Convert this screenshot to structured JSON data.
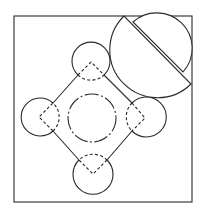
{
  "figure": {
    "type": "geometric-line-drawing",
    "colors": {
      "line": "#2a2a2a",
      "background": "#ffffff"
    },
    "frame": {
      "x": 14,
      "y": 16,
      "width": 178,
      "height": 186
    },
    "diamond_vertices": [
      {
        "name": "top",
        "cx": 91,
        "cy": 62
      },
      {
        "name": "right",
        "cx": 146,
        "cy": 118
      },
      {
        "name": "bottom",
        "cx": 93,
        "cy": 174
      },
      {
        "name": "left",
        "cx": 39,
        "cy": 117
      }
    ],
    "corner_circles": [
      {
        "name": "top",
        "cx": 91,
        "cy": 61,
        "r": 19
      },
      {
        "name": "right",
        "cx": 145,
        "cy": 116,
        "r": 20
      },
      {
        "name": "bottom",
        "cx": 93,
        "cy": 174,
        "r": 20
      },
      {
        "name": "left",
        "cx": 40,
        "cy": 118,
        "r": 19
      }
    ],
    "center_circle": {
      "cx": 92,
      "cy": 118,
      "r": 24,
      "style": "dash-dot"
    },
    "large_half_disc": {
      "chord_start": [
        124,
        16
      ],
      "chord_end": [
        191,
        84
      ],
      "r": 47.6
    },
    "small_half_disc": {
      "chord_start": [
        133,
        22
      ],
      "chord_end": [
        183,
        72
      ],
      "r": 35.4
    }
  }
}
